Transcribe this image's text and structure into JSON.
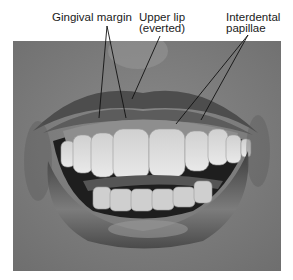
{
  "figure": {
    "type": "annotated-photograph",
    "colors": {
      "background": "#ffffff",
      "label_text": "#1a1a1a",
      "leader_line": "#111111"
    }
  },
  "labels": [
    {
      "id": "gingival-margin",
      "lines": [
        "Gingival margin"
      ]
    },
    {
      "id": "upper-lip",
      "lines": [
        "Upper lip",
        "(everted)"
      ]
    },
    {
      "id": "interdental-papillae",
      "lines": [
        "Interdental",
        "papillae"
      ]
    }
  ]
}
